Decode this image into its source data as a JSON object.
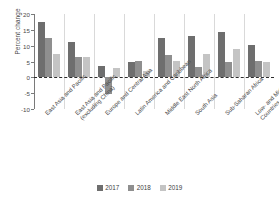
{
  "chart_data": {
    "type": "bar",
    "title": "",
    "xlabel": "",
    "ylabel": "Percent change",
    "ylim": [
      -10,
      20
    ],
    "yticks": [
      20,
      15,
      10,
      5,
      0,
      -5,
      -10
    ],
    "ytick_labels": [
      "20",
      "15",
      "10",
      "5",
      "0",
      "-5",
      "-10"
    ],
    "grid": false,
    "zero_reference_line": true,
    "legend_position": "bottom",
    "categories": [
      "East Asia and Pacific",
      "East Asia and Pacific\n(excluding China)",
      "Europe and Central Asia",
      "Latin America and Caribbean",
      "Middle East North Africa",
      "South Asia",
      "Sub-Saharan Africa",
      "Low- and Middle-income\nCountries"
    ],
    "series": [
      {
        "name": "2017",
        "color": "#6e6e6e",
        "values": [
          17.5,
          11.3,
          3.6,
          4.9,
          12.5,
          13.0,
          14.3,
          10.1
        ]
      },
      {
        "name": "2018",
        "color": "#8f8f8f",
        "values": [
          12.3,
          6.4,
          -5.2,
          5.1,
          7.1,
          3.4,
          4.8,
          5.1
        ]
      },
      {
        "name": "2019",
        "color": "#c4c4c4",
        "values": [
          7.3,
          6.3,
          3.0,
          2.1,
          5.1,
          7.3,
          8.9,
          5.0
        ]
      }
    ]
  },
  "legend": {
    "items": [
      {
        "label": "2017",
        "color": "#6e6e6e"
      },
      {
        "label": "2018",
        "color": "#8f8f8f"
      },
      {
        "label": "2019",
        "color": "#c4c4c4"
      }
    ]
  }
}
